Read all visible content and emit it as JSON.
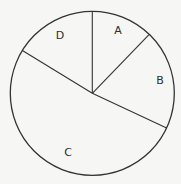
{
  "chart_data": {
    "type": "pie",
    "title": "",
    "categories": [
      "A",
      "B",
      "C",
      "D"
    ],
    "values": [
      12.2,
      19.7,
      51.8,
      16.3
    ],
    "angles_deg": [
      44,
      71,
      186.5,
      58.5
    ],
    "start_angle_deg": 90,
    "direction": "clockwise",
    "legend": "none",
    "labels_inside": true,
    "filled": false
  },
  "style": {
    "background": "#f6f6f4",
    "stroke": "#333333",
    "center": [
      92.3,
      93.3
    ],
    "radius": 82
  },
  "labels": {
    "A": {
      "text": "A",
      "pos": [
        118,
        34
      ]
    },
    "B": {
      "text": "B",
      "pos": [
        160,
        84
      ]
    },
    "C": {
      "text": "C",
      "pos": [
        68,
        156
      ]
    },
    "D": {
      "text": "D",
      "pos": [
        60,
        39
      ]
    }
  }
}
